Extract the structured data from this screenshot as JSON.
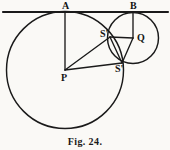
{
  "figure": {
    "caption": "Fig. 24.",
    "caption_position": {
      "top": 136
    },
    "stroke_color": "#1a1a1a",
    "background_color": "#faf9f6",
    "width": 170,
    "height": 150,
    "points": [
      {
        "id": "A",
        "label": "A",
        "x": 65,
        "y": 12,
        "label_x": 62,
        "label_y": 1
      },
      {
        "id": "B",
        "label": "B",
        "x": 133,
        "y": 12,
        "label_x": 130,
        "label_y": 1
      },
      {
        "id": "P",
        "label": "P",
        "x": 65,
        "y": 70,
        "label_x": 61,
        "label_y": 73
      },
      {
        "id": "Q",
        "label": "Q",
        "x": 133,
        "y": 38,
        "label_x": 137,
        "label_y": 33
      },
      {
        "id": "S",
        "label": "S'",
        "x": 110,
        "y": 37,
        "label_x": 100,
        "label_y": 29
      },
      {
        "id": "S2",
        "label": "S'",
        "x": 122,
        "y": 63,
        "label_x": 115,
        "label_y": 64
      }
    ],
    "circles": [
      {
        "id": "large-circle",
        "center": "P",
        "cx": 65,
        "cy": 70,
        "r": 58.5
      },
      {
        "id": "small-circle",
        "center": "Q",
        "cx": 133,
        "cy": 38,
        "r": 25.5
      }
    ],
    "tangent_line": {
      "id": "tangent-line",
      "x1": 3,
      "y1": 12,
      "x2": 168,
      "y2": 12
    },
    "segments": [
      {
        "id": "PA",
        "from": "P",
        "to": "A",
        "x1": 65,
        "y1": 70,
        "x2": 65,
        "y2": 12
      },
      {
        "id": "PS",
        "from": "P",
        "to": "S",
        "x1": 65,
        "y1": 70,
        "x2": 110,
        "y2": 37
      },
      {
        "id": "PS2",
        "from": "P",
        "to": "S2",
        "x1": 65,
        "y1": 70,
        "x2": 122,
        "y2": 63
      },
      {
        "id": "QB",
        "from": "Q",
        "to": "B",
        "x1": 133,
        "y1": 38,
        "x2": 133,
        "y2": 12
      },
      {
        "id": "QS",
        "from": "Q",
        "to": "S",
        "x1": 133,
        "y1": 38,
        "x2": 110,
        "y2": 37
      },
      {
        "id": "QS2",
        "from": "Q",
        "to": "S2",
        "x1": 133,
        "y1": 38,
        "x2": 122,
        "y2": 63
      },
      {
        "id": "SS2",
        "from": "S",
        "to": "S2",
        "x1": 110,
        "y1": 37,
        "x2": 122,
        "y2": 63
      }
    ]
  }
}
